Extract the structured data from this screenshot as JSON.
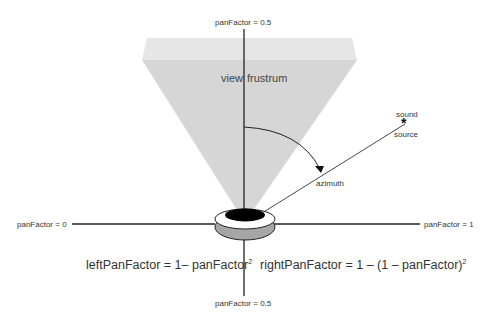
{
  "diagram": {
    "labels": {
      "top": "panFactor = 0.5",
      "bottom": "panFactor = 0.5",
      "left": "panFactor = 0",
      "right": "panFactor = 1",
      "view_frustrum_left": "view",
      "view_frustrum_right": "frustrum",
      "sound_top": "sound",
      "sound_bottom": "source",
      "sound_star": "*",
      "azimuth": "azimuth"
    },
    "formulas": {
      "left_main": "leftPanFactor = 1– panFactor",
      "left_exp": "2",
      "right_main": "rightPanFactor = 1 – (1 – panFactor)",
      "right_exp": "2"
    },
    "colors": {
      "frustum_top": "#e6e6e6",
      "frustum_body": "#d6d6d6",
      "axis": "#222222",
      "head_fill": "#000000",
      "ring": "#ffffff",
      "base": "#a6a6a6"
    }
  }
}
